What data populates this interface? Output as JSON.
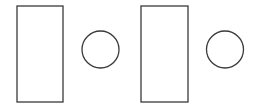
{
  "canvas": {
    "width": 255,
    "height": 110,
    "background_color": "#ffffff",
    "stroke_color": "#3a3a3a",
    "stroke_width": 1.3,
    "fill": "none"
  },
  "shapes": [
    {
      "name": "rectangle-1",
      "type": "rectangle",
      "x": 17,
      "y": 6,
      "width": 46,
      "height": 96
    },
    {
      "name": "circle-1",
      "type": "circle",
      "cx": 100.5,
      "cy": 49.5,
      "r": 18.5
    },
    {
      "name": "rectangle-2",
      "type": "rectangle",
      "x": 141,
      "y": 6,
      "width": 47,
      "height": 96
    },
    {
      "name": "circle-2",
      "type": "circle",
      "cx": 225,
      "cy": 49.5,
      "r": 18.5
    }
  ]
}
